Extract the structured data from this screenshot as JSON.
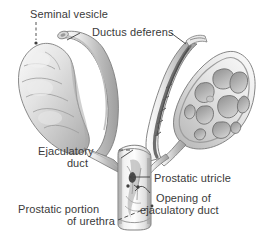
{
  "figure": {
    "kind": "anatomical-illustration",
    "background_color": "#ffffff",
    "label_color": "#3a3a3a",
    "ink_color": "#5a5a5a"
  },
  "labels": {
    "seminal_vesicle": "Seminal vesicle",
    "ductus_deferens": "Ductus deferens",
    "ejaculatory_duct_line1": "Ejaculatory",
    "ejaculatory_duct_line2": "duct",
    "prostatic_utricle": "Prostatic utricle",
    "opening_line1": "Opening of",
    "opening_line2": "ejaculatory duct",
    "prostatic_urethra_line1": "Prostatic portion",
    "prostatic_urethra_line2": "of urethra"
  }
}
